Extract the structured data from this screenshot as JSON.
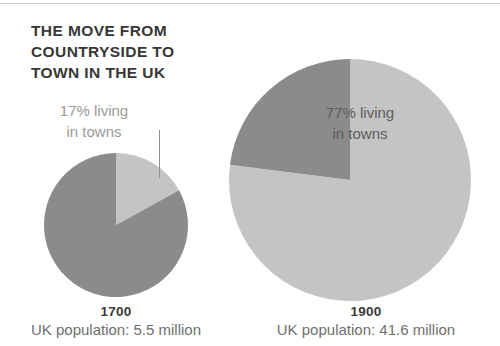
{
  "title": "The move from\ncountryside to\ntown in the UK",
  "colors": {
    "urban": "#c4c4c4",
    "rural": "#8b8b8b",
    "title_text": "#373737",
    "left_label_text": "#9b9b9b",
    "right_label_text": "#5c5c5c",
    "caption_year_text": "#3a3a3a",
    "caption_pop_text": "#6f6f6f",
    "leader_line": "#8e8e8e",
    "top_rule": "#c9c9c9",
    "background": "#ffffff"
  },
  "panels": [
    {
      "id": "pie-1700",
      "year": "1700",
      "population_label": "UK population: 5.5 million",
      "callout": "17% living\nin towns",
      "urban_percent": 17,
      "rural_percent": 83,
      "center_x": 116,
      "center_y": 225,
      "radius": 72,
      "start_angle_deg": 0
    },
    {
      "id": "pie-1900",
      "year": "1900",
      "population_label": "UK population: 41.6 million",
      "callout": "77% living\nin towns",
      "urban_percent": 77,
      "rural_percent": 23,
      "center_x": 350,
      "center_y": 180,
      "radius": 121,
      "start_angle_deg": 0
    }
  ],
  "chart_data": {
    "type": "pie",
    "title": "The move from countryside to town in the UK",
    "subtitle": "",
    "xlabel": "",
    "ylabel": "",
    "legend_position": "inline-annotation",
    "grid": false,
    "unit": "percent of UK population",
    "series": [
      {
        "name": "1700",
        "population_millions": 5.5,
        "slices": [
          {
            "label": "living in towns",
            "value": 17
          },
          {
            "label": "living in countryside",
            "value": 83
          }
        ]
      },
      {
        "name": "1900",
        "population_millions": 41.6,
        "slices": [
          {
            "label": "living in towns",
            "value": 77
          },
          {
            "label": "living in countryside",
            "value": 23
          }
        ]
      }
    ],
    "annotations": [
      "17% living in towns",
      "77% living in towns"
    ]
  }
}
